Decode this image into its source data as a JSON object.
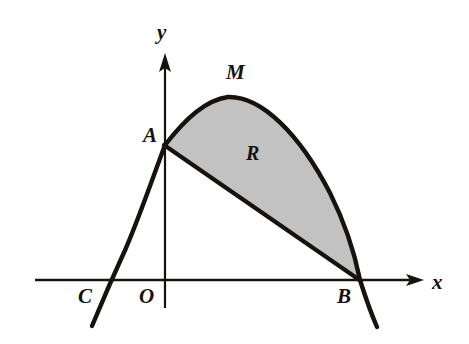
{
  "figure": {
    "type": "geometry-diagram",
    "background_color": "#ffffff",
    "stroke_color": "#15120f",
    "axis_color": "#15120f",
    "shaded_fill_color": "#c2c2c2"
  },
  "axes": {
    "x_axis": {
      "label": "x",
      "label_x": 432,
      "label_y": 272,
      "line": {
        "x1": 35,
        "y1": 280,
        "x2": 424,
        "y2": 280
      },
      "arrow": "right"
    },
    "y_axis": {
      "label": "y",
      "label_x": 157,
      "label_y": 22,
      "line": {
        "x1": 165,
        "y1": 306,
        "x2": 165,
        "y2": 55
      },
      "arrow": "up"
    },
    "origin": {
      "label": "O",
      "label_x": 139,
      "label_y": 286,
      "x": 165,
      "y": 280
    }
  },
  "points": [
    {
      "name": "A",
      "label": "A",
      "label_x": 143,
      "label_y": 125,
      "x": 165,
      "y": 145,
      "description": "y-intercept of parabola, left end of chord"
    },
    {
      "name": "M",
      "label": "M",
      "label_x": 226,
      "label_y": 62,
      "x": 228,
      "y": 97,
      "description": "vertex / maximum of parabola"
    },
    {
      "name": "B",
      "label": "B",
      "label_x": 337,
      "label_y": 286,
      "x": 360,
      "y": 280,
      "description": "right x-intercept, right end of chord"
    },
    {
      "name": "C",
      "label": "C",
      "label_x": 78,
      "label_y": 286,
      "x": 101,
      "y": 280,
      "description": "left x-intercept of parabola"
    }
  ],
  "region": {
    "label": "R",
    "label_x": 246,
    "label_y": 143,
    "description": "shaded area bounded above by the parabola arc from A to B and below by the chord AB"
  },
  "curve": {
    "name": "parabola",
    "opens": "downward",
    "path": "M 92,325 Q 140,210 165,145 Q 200,105 228,97 Q 300,98 360,280 L 376,326",
    "chord": {
      "name": "chord-AB",
      "x1": 165,
      "y1": 145,
      "x2": 360,
      "y2": 280
    }
  }
}
